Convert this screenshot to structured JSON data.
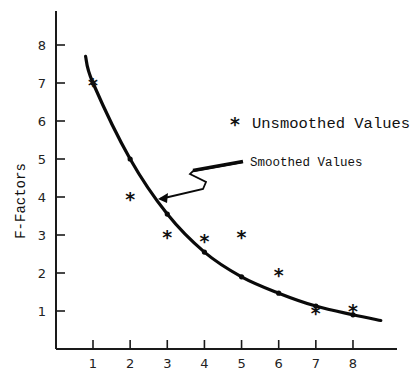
{
  "chart_data": {
    "type": "line",
    "title": "",
    "xlabel": "",
    "ylabel": "F-Factors",
    "x": [
      1,
      2,
      3,
      4,
      5,
      6,
      7,
      8
    ],
    "x_ticks": [
      "1",
      "2",
      "3",
      "4",
      "5",
      "6",
      "7",
      "8"
    ],
    "y_ticks": [
      "1",
      "2",
      "3",
      "4",
      "5",
      "6",
      "7",
      "8"
    ],
    "xlim": [
      0,
      9
    ],
    "ylim": [
      0,
      8.8
    ],
    "grid": false,
    "series": [
      {
        "name": "Smoothed Values",
        "style": "smooth curve with dot markers",
        "values": [
          7.0,
          5.0,
          3.55,
          2.55,
          1.9,
          1.47,
          1.13,
          0.9
        ],
        "curve_extent": {
          "start": [
            0.8,
            7.7
          ],
          "end": [
            8.75,
            0.75
          ]
        }
      },
      {
        "name": "Unsmoothed Values",
        "style": "asterisk markers",
        "marker": "*",
        "values": [
          7.0,
          4.0,
          3.0,
          2.9,
          3.0,
          2.0,
          1.0,
          1.05
        ]
      }
    ],
    "annotations": [
      {
        "text": "Smoothed Values",
        "arrow_to": [
          2.75,
          3.95
        ]
      }
    ],
    "legend": {
      "marker": "*",
      "label": "Unsmoothed Values",
      "position": "upper-right"
    }
  }
}
